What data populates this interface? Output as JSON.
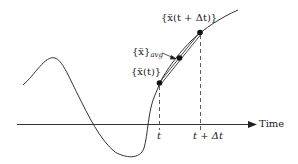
{
  "diagram": {
    "axis_label": "Time",
    "ticks": [
      {
        "label": "t"
      },
      {
        "label": "t + Δt"
      }
    ],
    "point_labels": {
      "start": "{ẍ(t)}",
      "average_main": "{ẍ}",
      "average_sub": "avg",
      "end": "{ẍ(t + Δt)}"
    },
    "colors": {
      "line": "#333333",
      "background": "#ffffff"
    }
  }
}
